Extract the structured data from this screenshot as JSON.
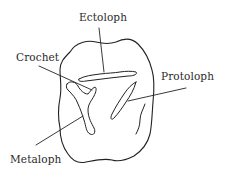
{
  "diagram": {
    "stroke_color": "#222222",
    "background": "#ffffff",
    "labels": [
      {
        "id": "ectoloph",
        "text": "Ectoloph"
      },
      {
        "id": "crochet",
        "text": "Crochet"
      },
      {
        "id": "protoloph",
        "text": "Protoloph"
      },
      {
        "id": "metaloph",
        "text": "Metaloph"
      }
    ]
  }
}
